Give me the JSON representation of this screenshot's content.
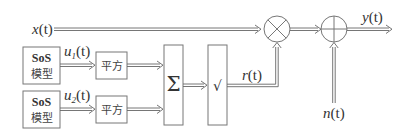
{
  "diagram": {
    "inputs": {
      "x": {
        "var": "x",
        "arg": "(t)"
      },
      "u1": {
        "var": "u",
        "sub": "1",
        "arg": "(t)"
      },
      "u2": {
        "var": "u",
        "sub": "2",
        "arg": "(t)"
      },
      "n": {
        "var": "n",
        "arg": "(t)"
      }
    },
    "intermediate": {
      "r": {
        "var": "r",
        "arg": "(t)"
      }
    },
    "output": {
      "y": {
        "var": "y",
        "arg": "(t)"
      }
    },
    "blocks": {
      "sos1": {
        "line1": "SoS",
        "line2": "模型"
      },
      "sos2": {
        "line1": "SoS",
        "line2": "模型"
      },
      "square1": {
        "label": "平方"
      },
      "square2": {
        "label": "平方"
      },
      "sum": {
        "label": "Σ"
      },
      "sqrt": {
        "label": "√"
      }
    },
    "nodes": {
      "multiplier": {
        "symbol": "×"
      },
      "adder": {
        "symbol": "+"
      }
    },
    "colors": {
      "line": "#666666",
      "text": "#333333",
      "background": "#ffffff"
    }
  }
}
